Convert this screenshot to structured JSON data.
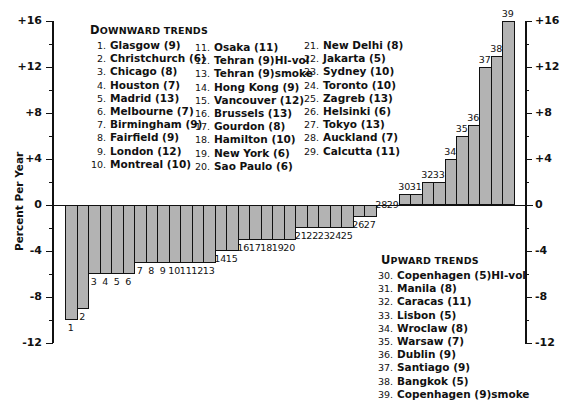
{
  "chart_data": {
    "type": "bar",
    "title": "",
    "xlabel": "",
    "ylabel": "Percent Per Year",
    "ylim": [
      -12,
      16
    ],
    "yticks": [
      "+16",
      "+12",
      "+8",
      "+4",
      "0",
      "-4",
      "-8",
      "-12"
    ],
    "grid": false,
    "categories": [
      "1",
      "2",
      "3",
      "4",
      "5",
      "6",
      "7",
      "8",
      "9",
      "10",
      "11",
      "12",
      "13",
      "14",
      "15",
      "16",
      "17",
      "18",
      "19",
      "20",
      "21",
      "22",
      "23",
      "24",
      "25",
      "26",
      "27",
      "28",
      "29",
      "30",
      "31",
      "32",
      "33",
      "34",
      "35",
      "36",
      "37",
      "38",
      "39"
    ],
    "values": [
      -10,
      -9,
      -6,
      -6,
      -6,
      -6,
      -5,
      -5,
      -5,
      -5,
      -5,
      -5,
      -5,
      -4,
      -4,
      -3,
      -3,
      -3,
      -3,
      -3,
      -2,
      -2,
      -2,
      -2,
      -2,
      -1,
      -1,
      0,
      0,
      1,
      1,
      2,
      2,
      4,
      6,
      7,
      12,
      13,
      16
    ],
    "legend": {
      "downward": {
        "title_cap": "D",
        "title_rest": "OWNWARD TRENDS",
        "columns": [
          [
            {
              "num": "1.",
              "name": "Glasgow (9)"
            },
            {
              "num": "2.",
              "name": "Christchurch (6)"
            },
            {
              "num": "3.",
              "name": "Chicago (8)"
            },
            {
              "num": "4.",
              "name": "Houston (7)"
            },
            {
              "num": "5.",
              "name": "Madrid (13)"
            },
            {
              "num": "6.",
              "name": "Melbourne (7)"
            },
            {
              "num": "7.",
              "name": "Birmingham (9)"
            },
            {
              "num": "8.",
              "name": "Fairfield (9)"
            },
            {
              "num": "9.",
              "name": "London (12)"
            },
            {
              "num": "10.",
              "name": "Montreal (10)"
            }
          ],
          [
            {
              "num": "11.",
              "name": "Osaka (11)"
            },
            {
              "num": "12.",
              "name": "Tehran (9)HI-vol"
            },
            {
              "num": "13.",
              "name": "Tehran (9)smoke"
            },
            {
              "num": "14.",
              "name": "Hong Kong (9)"
            },
            {
              "num": "15.",
              "name": "Vancouver (12)"
            },
            {
              "num": "16.",
              "name": "Brussels (13)"
            },
            {
              "num": "17.",
              "name": "Gourdon (8)"
            },
            {
              "num": "18.",
              "name": "Hamilton (10)"
            },
            {
              "num": "19.",
              "name": "New York (6)"
            },
            {
              "num": "20.",
              "name": "Sao Paulo (6)"
            }
          ],
          [
            {
              "num": "21.",
              "name": "New Delhi (8)"
            },
            {
              "num": "22.",
              "name": "Jakarta (5)"
            },
            {
              "num": "23.",
              "name": "Sydney (10)"
            },
            {
              "num": "24.",
              "name": "Toronto (10)"
            },
            {
              "num": "25.",
              "name": "Zagreb (13)"
            },
            {
              "num": "26.",
              "name": "Helsinki (6)"
            },
            {
              "num": "27.",
              "name": "Tokyo (13)"
            },
            {
              "num": "28.",
              "name": "Auckland (7)"
            },
            {
              "num": "29.",
              "name": "Calcutta (11)"
            }
          ]
        ]
      },
      "upward": {
        "title_cap": "U",
        "title_rest": "PWARD TRENDS",
        "items": [
          {
            "num": "30.",
            "name": "Copenhagen (5)HI-vol"
          },
          {
            "num": "31.",
            "name": "Manila (8)"
          },
          {
            "num": "32.",
            "name": "Caracas (11)"
          },
          {
            "num": "33.",
            "name": "Lisbon (5)"
          },
          {
            "num": "34.",
            "name": "Wroclaw (8)"
          },
          {
            "num": "35.",
            "name": "Warsaw (7)"
          },
          {
            "num": "36.",
            "name": "Dublin (9)"
          },
          {
            "num": "37.",
            "name": "Santiago (9)"
          },
          {
            "num": "38.",
            "name": "Bangkok (5)"
          },
          {
            "num": "39.",
            "name": "Copenhagen (9)smoke"
          }
        ]
      }
    }
  },
  "colors": {
    "bar_fill": "#d6d6d6",
    "bar_edge": "#111111",
    "axis": "#111111"
  }
}
